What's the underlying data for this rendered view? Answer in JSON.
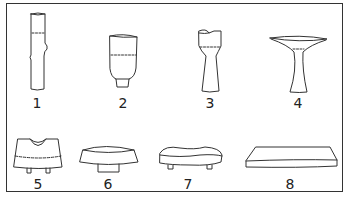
{
  "figure": {
    "items": [
      {
        "number": "1",
        "name": "tall cylindrical stem"
      },
      {
        "number": "2",
        "name": "cup with short foot"
      },
      {
        "number": "3",
        "name": "goblet with notched rim and tapering stem"
      },
      {
        "number": "4",
        "name": "wide dish on flared stem"
      },
      {
        "number": "5",
        "name": "notched block on two legs"
      },
      {
        "number": "6",
        "name": "low round tray on foot"
      },
      {
        "number": "7",
        "name": "irregular flat slab on feet"
      },
      {
        "number": "8",
        "name": "flat rectangular slab"
      }
    ]
  },
  "colors": {
    "line": "#333333",
    "background": "#ffffff"
  }
}
